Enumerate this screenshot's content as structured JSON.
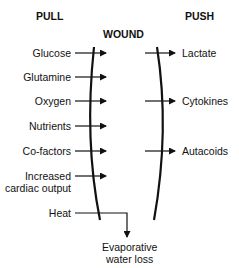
{
  "headers": {
    "pull": "PULL",
    "push": "PUSH",
    "wound": "WOUND"
  },
  "pull_items": [
    {
      "label": "Glucose",
      "y": 53
    },
    {
      "label": "Glutamine",
      "y": 77
    },
    {
      "label": "Oxygen",
      "y": 101
    },
    {
      "label": "Nutrients",
      "y": 126
    },
    {
      "label": "Co-factors",
      "y": 151
    },
    {
      "label": "Increased",
      "label2": "cardiac output",
      "y": 176
    },
    {
      "label": "Heat",
      "y": 213
    }
  ],
  "push_items": [
    {
      "label": "Lactate",
      "y": 53
    },
    {
      "label": "Cytokines",
      "y": 101
    },
    {
      "label": "Autacoids",
      "y": 151
    }
  ],
  "outcome": {
    "line1": "Evaporative",
    "line2": "water loss"
  },
  "colors": {
    "line": "#111111",
    "background": "#ffffff"
  }
}
